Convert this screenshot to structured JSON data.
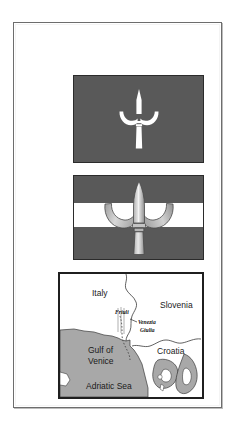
{
  "document": {
    "kind": "scanned-illustration-page",
    "background_color": "#ffffff",
    "frame_border_color": "#6d6d6d"
  },
  "figures": [
    {
      "id": "flag-trieste-plain",
      "name": "Flag of Trieste (plain field with halberd)",
      "field_color": "#595959",
      "emblem": "halberd",
      "emblem_color": "#ffffff",
      "stripes": 1
    },
    {
      "id": "flag-trieste-tricolor",
      "name": "Flag of Trieste (red-white-red with halberd)",
      "field_color": "#595959",
      "stripe_color": "#ffffff",
      "emblem": "halberd",
      "emblem_color": "#c8c8c8",
      "stripes": 3
    }
  ],
  "map": {
    "name": "Map of the northern Adriatic region",
    "land_color": "#ffffff",
    "sea_color": "#a8a8a8",
    "border_color": "#1f1f1f",
    "labels": [
      {
        "text": "Italy",
        "style": "large",
        "x": 32,
        "y": 22
      },
      {
        "text": "Friuli",
        "style": "small",
        "x": 55,
        "y": 40
      },
      {
        "text": "Slovenia",
        "style": "large",
        "x": 100,
        "y": 34
      },
      {
        "text": "Venezia",
        "style": "small",
        "x": 78,
        "y": 50
      },
      {
        "text": "Giulia",
        "style": "small",
        "x": 80,
        "y": 58
      },
      {
        "text": "Gulf of",
        "style": "large",
        "x": 28,
        "y": 79
      },
      {
        "text": "Venice",
        "style": "large",
        "x": 28,
        "y": 90
      },
      {
        "text": "Croatia",
        "style": "large",
        "x": 97,
        "y": 80
      },
      {
        "text": "Adriatic Sea",
        "style": "large",
        "x": 26,
        "y": 115
      }
    ]
  }
}
